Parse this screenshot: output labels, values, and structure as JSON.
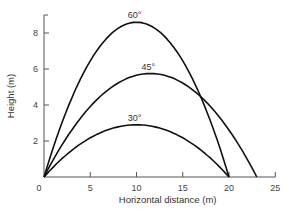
{
  "chart_data": {
    "type": "line",
    "title": "",
    "xlabel": "Horizontal distance (m)",
    "ylabel": "Height (m)",
    "xlim": [
      0,
      25
    ],
    "ylim": [
      0,
      9
    ],
    "xticks": [
      0,
      5,
      10,
      15,
      20,
      25
    ],
    "yticks": [
      2,
      4,
      6,
      8
    ],
    "origin_label": "0",
    "grid": false,
    "legend": "none (curves labeled inline)",
    "series": [
      {
        "name": "60°",
        "label": "60°",
        "launch_angle_deg": 60,
        "peak": {
          "x": 10,
          "y": 8.6
        },
        "range": 20,
        "x": [
          0,
          2.5,
          5,
          7.5,
          10,
          12.5,
          15,
          17.5,
          20
        ],
        "y": [
          0,
          3.8,
          6.5,
          8.1,
          8.6,
          8.1,
          6.5,
          3.8,
          0
        ]
      },
      {
        "name": "45°",
        "label": "45°",
        "launch_angle_deg": 45,
        "peak": {
          "x": 11.5,
          "y": 5.75
        },
        "range": 23,
        "x": [
          0,
          2.5,
          5,
          7.5,
          10,
          11.5,
          15,
          17.5,
          20,
          23
        ],
        "y": [
          0,
          2.3,
          4.0,
          5.1,
          5.65,
          5.75,
          5.2,
          4.2,
          2.7,
          0
        ]
      },
      {
        "name": "30°",
        "label": "30°",
        "launch_angle_deg": 30,
        "peak": {
          "x": 10,
          "y": 2.9
        },
        "range": 20,
        "x": [
          0,
          2.5,
          5,
          7.5,
          10,
          12.5,
          15,
          17.5,
          20
        ],
        "y": [
          0,
          1.27,
          2.17,
          2.72,
          2.9,
          2.72,
          2.17,
          1.27,
          0
        ]
      }
    ]
  }
}
